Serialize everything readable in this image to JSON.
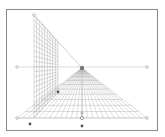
{
  "canvas": {
    "width": 165,
    "height": 137,
    "background": "#ffffff"
  },
  "frame": {
    "x": 6,
    "y": 9,
    "width": 151,
    "height": 121,
    "stroke": "#8a8a8a"
  },
  "colors": {
    "grid": "#b4b4b4",
    "guide": "#c8c8c8",
    "handle": "#9a9a9a",
    "handle_dark": "#555555",
    "vp": "#777777"
  },
  "horizon": {
    "y": 67,
    "x1": 17,
    "x2": 147
  },
  "vanishing_point": {
    "x": 82,
    "y": 68
  },
  "wall": {
    "near_x": 34,
    "near_top": 15,
    "near_bottom": 118,
    "far_x": 58,
    "far_top": 42,
    "far_bottom": 92,
    "cols": 9,
    "rows": 20
  },
  "floor": {
    "base_y": 118,
    "left_x": 17,
    "right_x": 147,
    "radials": 24,
    "rows": 12
  },
  "handles": [
    {
      "name": "wall-top-handle",
      "x": 34,
      "y": 15,
      "style": "hollow"
    },
    {
      "name": "horizon-left-handle",
      "x": 17,
      "y": 67,
      "style": "hollow"
    },
    {
      "name": "horizon-right-handle",
      "x": 147,
      "y": 67,
      "style": "hollow"
    },
    {
      "name": "floor-left-handle",
      "x": 17,
      "y": 118,
      "style": "hollow"
    },
    {
      "name": "floor-right-handle",
      "x": 147,
      "y": 118,
      "style": "hollow"
    },
    {
      "name": "wall-corner-handle",
      "x": 30,
      "y": 124,
      "style": "dark"
    },
    {
      "name": "center-crosshair-handle",
      "x": 82,
      "y": 113,
      "style": "cross"
    },
    {
      "name": "center-ring-handle",
      "x": 82,
      "y": 118,
      "style": "ring"
    },
    {
      "name": "center-bottom-handle",
      "x": 82,
      "y": 126,
      "style": "dark"
    },
    {
      "name": "wall-far-handle",
      "x": 58,
      "y": 92,
      "style": "dark"
    }
  ]
}
